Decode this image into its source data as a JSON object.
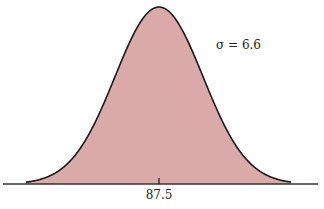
{
  "chart_data": {
    "type": "area",
    "title": "",
    "mean": 87.5,
    "sigma": 6.6,
    "x_tick_labels": [
      "87.5"
    ],
    "annotations": [
      "σ = 6.6"
    ],
    "xlabel": "",
    "ylabel": "",
    "grid": false,
    "legend": null,
    "fill_color": "#d9aaa7",
    "line_color": "#1a1a1a"
  },
  "labels": {
    "mean_tick": "87.5",
    "sigma_annotation": "σ = 6.6"
  }
}
